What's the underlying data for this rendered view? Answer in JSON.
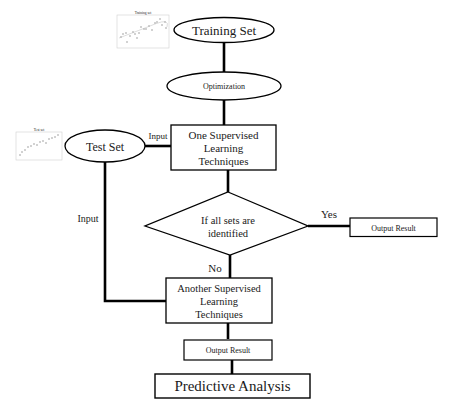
{
  "diagram": {
    "type": "flowchart",
    "nodes": {
      "training_set": {
        "label": "Training Set",
        "shape": "ellipse"
      },
      "optimization": {
        "label": "Optimization",
        "shape": "ellipse"
      },
      "test_set": {
        "label": "Test Set",
        "shape": "ellipse"
      },
      "one_supervised": {
        "lines": [
          "One Supervised",
          "Learning",
          "Techniques"
        ],
        "shape": "rectangle"
      },
      "decision": {
        "lines": [
          "If all sets are",
          "identified"
        ],
        "shape": "diamond"
      },
      "output_result_yes": {
        "label": "Output Result",
        "shape": "rectangle"
      },
      "another_supervised": {
        "lines": [
          "Another Supervised",
          "Learning",
          "Techniques"
        ],
        "shape": "rectangle"
      },
      "output_result_final": {
        "label": "Output Result",
        "shape": "rectangle"
      },
      "predictive_analysis": {
        "label": "Predictive Analysis",
        "shape": "rectangle"
      }
    },
    "edge_labels": {
      "test_to_one": "Input",
      "test_to_another": "Input",
      "yes": "Yes",
      "no": "No"
    },
    "edges": [
      [
        "training_set",
        "optimization"
      ],
      [
        "optimization",
        "one_supervised"
      ],
      [
        "test_set",
        "one_supervised"
      ],
      [
        "one_supervised",
        "decision"
      ],
      [
        "decision",
        "output_result_yes"
      ],
      [
        "decision",
        "another_supervised"
      ],
      [
        "test_set",
        "another_supervised"
      ],
      [
        "another_supervised",
        "output_result_final"
      ],
      [
        "output_result_final",
        "predictive_analysis"
      ]
    ],
    "thumbnails": {
      "training_plot_title": "Training set",
      "test_plot_title": "Test set"
    }
  }
}
